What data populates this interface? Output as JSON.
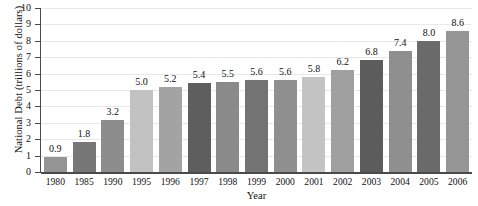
{
  "chart_data": {
    "type": "bar",
    "title": "",
    "xlabel": "Year",
    "ylabel": "National Debt (trillions of dollars)",
    "categories": [
      "1980",
      "1985",
      "1990",
      "1995",
      "1996",
      "1997",
      "1998",
      "1999",
      "2000",
      "2001",
      "2002",
      "2003",
      "2004",
      "2005",
      "2006"
    ],
    "values": [
      0.9,
      1.8,
      3.2,
      5.0,
      5.2,
      5.4,
      5.5,
      5.6,
      5.6,
      5.8,
      6.2,
      6.8,
      7.4,
      8.0,
      8.6
    ],
    "value_labels": [
      "0.9",
      "1.8",
      "3.2",
      "5.0",
      "5.2",
      "5.4",
      "5.5",
      "5.6",
      "5.6",
      "5.8",
      "6.2",
      "6.8",
      "7.4",
      "8.0",
      "8.6"
    ],
    "bar_colors": [
      "#949494",
      "#777777",
      "#8d8d8d",
      "#c2c2c2",
      "#a3a3a3",
      "#5e5e5e",
      "#8a8a8a",
      "#737373",
      "#8f8f8f",
      "#c4c4c4",
      "#a0a0a0",
      "#5c5c5c",
      "#8f8f8f",
      "#6a6a6a",
      "#969696"
    ],
    "ylim": [
      0,
      10
    ],
    "yticks": [
      0,
      1,
      2,
      3,
      4,
      5,
      6,
      7,
      8,
      9,
      10
    ],
    "ytick_labels": [
      "0",
      "1",
      "2",
      "3",
      "4",
      "5",
      "6",
      "7",
      "8",
      "9",
      "10"
    ],
    "grid": true,
    "grid_axis": "y",
    "grid_color": "#e8e8e8",
    "legend": false,
    "axis_color": "#4a4a4a",
    "background": "#ffffff"
  }
}
